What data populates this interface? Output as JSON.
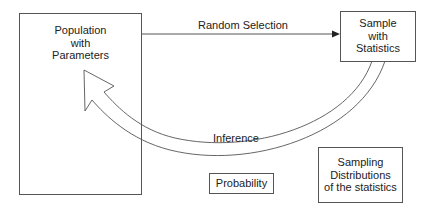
{
  "diagram": {
    "nodes": {
      "population": {
        "lines": [
          "Population",
          "with",
          "Parameters"
        ]
      },
      "sample": {
        "lines": [
          "Sample",
          "with",
          "Statistics"
        ]
      },
      "probability": {
        "label": "Probability"
      },
      "sampling": {
        "lines": [
          "Sampling",
          "Distributions",
          "of the statistics"
        ]
      }
    },
    "edges": {
      "random_selection": {
        "label": "Random Selection",
        "from": "population",
        "to": "sample"
      },
      "inference": {
        "label": "Inference",
        "from": "sample",
        "to": "population"
      }
    },
    "colors": {
      "stroke": "#555555",
      "text": "#222222",
      "background": "#ffffff"
    }
  }
}
